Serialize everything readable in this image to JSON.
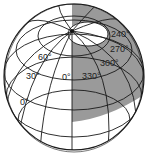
{
  "diagram": {
    "title": "",
    "labels": {
      "lat0": "0°",
      "lat30": "30°",
      "lat60": "60°",
      "lon0": "0°",
      "lon330": "330°",
      "lon300": "300°",
      "lon270": "270°",
      "lon240": "240°"
    },
    "colors": {
      "shade": "#9a9a9a",
      "line": "#1a1a1a",
      "background": "#ffffff"
    }
  }
}
